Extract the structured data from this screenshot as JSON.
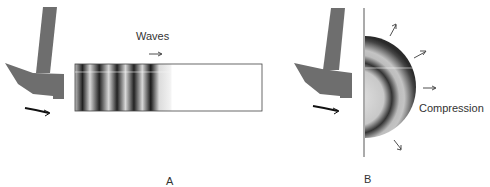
{
  "panel_a": {
    "label": "A",
    "waves_label": "Waves"
  },
  "panel_b": {
    "label": "B",
    "compression_label": "Compression"
  },
  "colors": {
    "hammer": "#6e6e6e",
    "wave_dark": "#1a1a1a",
    "wave_light": "#e6e6e6",
    "outline": "#333333"
  }
}
